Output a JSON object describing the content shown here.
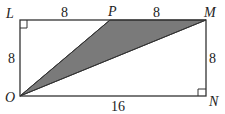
{
  "diagram": {
    "colors": {
      "stroke": "#333333",
      "shade": "#7a7a7a",
      "background": "#ffffff"
    },
    "points": {
      "L": {
        "label": "L",
        "x": 20,
        "y": 20
      },
      "P": {
        "label": "P",
        "x": 110,
        "y": 20
      },
      "M": {
        "label": "M",
        "x": 206,
        "y": 20
      },
      "N": {
        "label": "N",
        "x": 206,
        "y": 96
      },
      "O": {
        "label": "O",
        "x": 20,
        "y": 96
      }
    },
    "lengths": {
      "LP": "8",
      "PM": "8",
      "LO": "8",
      "MN": "8",
      "ON": "16"
    },
    "shaded_triangle": [
      "O",
      "P",
      "M"
    ],
    "right_angles": [
      "L",
      "N"
    ]
  }
}
